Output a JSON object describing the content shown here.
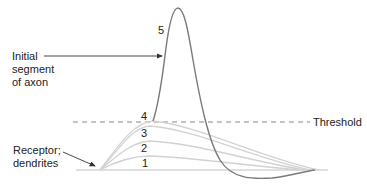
{
  "labels": {
    "initial_segment": [
      "Initial",
      "segment",
      "of axon"
    ],
    "receptor": [
      "Receptor;",
      "dendrites"
    ],
    "threshold": "Threshold"
  },
  "curve_numbers": [
    "1",
    "2",
    "3",
    "4",
    "5"
  ],
  "colors": {
    "baseline": "#d6d6d6",
    "subthreshold_curves": "#d2d2d2",
    "action_potential": "#7a7a7a",
    "threshold_dash": "#888888",
    "arrows": "#333333",
    "text": "#222222"
  }
}
